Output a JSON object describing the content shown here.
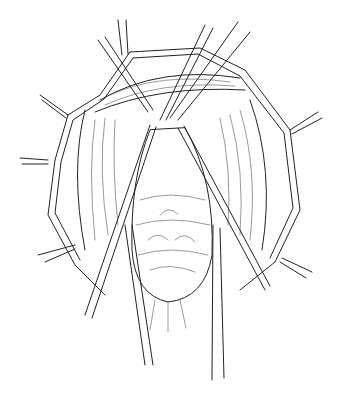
{
  "illustration": {
    "subject": "surgical-exposure-line-drawing",
    "style": "black ink line art on white",
    "colors": {
      "background": "#ffffff",
      "ink": "#222222"
    },
    "elements": [
      "retractors",
      "forceps",
      "clamps",
      "exposed-mass",
      "tissue-flaps"
    ]
  }
}
